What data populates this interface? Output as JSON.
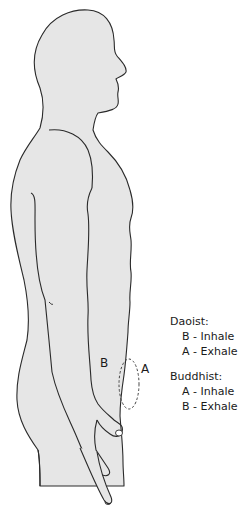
{
  "figure": {
    "fill_color": "#e6e6e6",
    "stroke_color": "#2a2a2a",
    "marker_labels": {
      "a": "A",
      "b": "B"
    }
  },
  "legend": {
    "groups": [
      {
        "title": "Daoist:",
        "entries": [
          "B - Inhale",
          "A - Exhale"
        ]
      },
      {
        "title": "Buddhist:",
        "entries": [
          "A - Inhale",
          "B - Exhale"
        ]
      }
    ]
  }
}
